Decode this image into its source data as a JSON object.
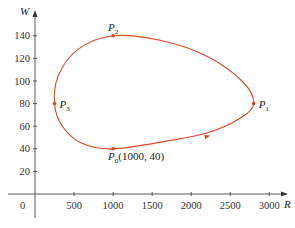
{
  "chart_data": {
    "type": "line",
    "title": "",
    "xlabel": "R",
    "ylabel": "W",
    "xlim": [
      0,
      3200
    ],
    "ylim": [
      0,
      150
    ],
    "x_ticks": [
      500,
      1000,
      1500,
      2000,
      2500,
      3000
    ],
    "y_ticks": [
      20,
      40,
      60,
      80,
      100,
      120,
      140
    ],
    "origin_label": "0",
    "grid": false,
    "curve_color": "#d9492a",
    "series": [
      {
        "name": "phase trajectory (closed curve)",
        "points": [
          {
            "R": 1000,
            "W": 40
          },
          {
            "R": 1700,
            "W": 47
          },
          {
            "R": 2200,
            "W": 54
          },
          {
            "R": 2600,
            "W": 66
          },
          {
            "R": 2800,
            "W": 80
          },
          {
            "R": 2650,
            "W": 100
          },
          {
            "R": 2200,
            "W": 122
          },
          {
            "R": 1600,
            "W": 136
          },
          {
            "R": 1000,
            "W": 140
          },
          {
            "R": 550,
            "W": 128
          },
          {
            "R": 300,
            "W": 105
          },
          {
            "R": 250,
            "W": 80
          },
          {
            "R": 350,
            "W": 60
          },
          {
            "R": 600,
            "W": 45
          },
          {
            "R": 1000,
            "W": 40
          }
        ]
      }
    ],
    "annotations": [
      {
        "id": "P0",
        "text": "P",
        "sub": "0",
        "suffix": "(1000, 40)",
        "R": 1000,
        "W": 40
      },
      {
        "id": "P1",
        "text": "P",
        "sub": "1",
        "suffix": "",
        "R": 2800,
        "W": 80
      },
      {
        "id": "P2",
        "text": "P",
        "sub": "2",
        "suffix": "",
        "R": 1000,
        "W": 140
      },
      {
        "id": "P3",
        "text": "P",
        "sub": "3",
        "suffix": "",
        "R": 250,
        "W": 80
      }
    ],
    "direction": "counterclockwise (arrow on lower branch pointing toward P1)"
  }
}
